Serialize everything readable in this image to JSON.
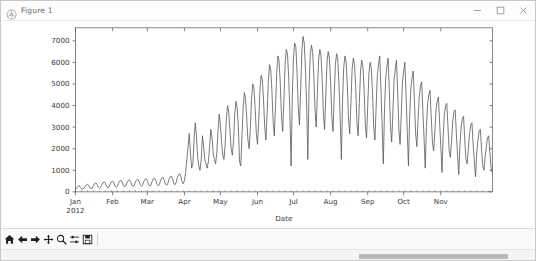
{
  "window": {
    "title": "Figure 1",
    "icon": "matplotlib-icon",
    "controls": {
      "minimize": "minimize-icon",
      "maximize": "maximize-icon",
      "close": "close-icon"
    }
  },
  "toolbar": {
    "items": [
      {
        "name": "home-icon",
        "tooltip": "Reset original view"
      },
      {
        "name": "back-arrow-icon",
        "tooltip": "Back to previous view"
      },
      {
        "name": "forward-arrow-icon",
        "tooltip": "Forward to next view"
      },
      {
        "name": "pan-move-icon",
        "tooltip": "Pan axes with left mouse, zoom with right"
      },
      {
        "name": "zoom-magnifier-icon",
        "tooltip": "Zoom to rectangle"
      },
      {
        "name": "subplot-config-icon",
        "tooltip": "Configure subplots"
      },
      {
        "name": "save-floppy-icon",
        "tooltip": "Save the figure"
      }
    ]
  },
  "scrollbar": {
    "orientation": "horizontal",
    "thumb_left_pct": 67,
    "thumb_width_pct": 28
  },
  "chart_data": {
    "type": "line",
    "title": "",
    "xlabel": "Date",
    "ylabel": "",
    "grid": false,
    "legend": null,
    "line_color": "#555555",
    "line_width": 0.8,
    "ylim": [
      0,
      7600
    ],
    "yticks": [
      0,
      1000,
      2000,
      3000,
      4000,
      5000,
      6000,
      7000
    ],
    "ytick_labels": [
      "0",
      "1000",
      "2000",
      "3000",
      "4000",
      "5000",
      "6000",
      "7000"
    ],
    "xlim": [
      "2012-01-01",
      "2012-11-01"
    ],
    "xticks": [
      "2012-01-01",
      "2012-02-01",
      "2012-03-01",
      "2012-04-01",
      "2012-05-01",
      "2012-06-01",
      "2012-07-01",
      "2012-08-01",
      "2012-09-01",
      "2012-10-01",
      "2012-11-01"
    ],
    "xtick_labels": [
      "Jan",
      "Feb",
      "Mar",
      "Apr",
      "May",
      "Jun",
      "Jul",
      "Aug",
      "Sep",
      "Oct",
      "Nov"
    ],
    "xtick_sublabel_first": "2012",
    "x_start": "2012-01-01",
    "x_step_days": 1,
    "values": [
      120,
      180,
      240,
      300,
      210,
      150,
      130,
      160,
      250,
      320,
      360,
      300,
      190,
      150,
      180,
      290,
      380,
      420,
      350,
      220,
      170,
      200,
      330,
      430,
      470,
      400,
      250,
      190,
      230,
      370,
      470,
      500,
      430,
      280,
      210,
      250,
      400,
      500,
      540,
      460,
      300,
      230,
      270,
      420,
      520,
      560,
      480,
      320,
      250,
      290,
      450,
      550,
      590,
      500,
      340,
      260,
      300,
      470,
      580,
      610,
      520,
      350,
      270,
      310,
      480,
      600,
      640,
      540,
      360,
      280,
      330,
      520,
      640,
      680,
      570,
      380,
      300,
      360,
      560,
      690,
      730,
      620,
      410,
      330,
      420,
      660,
      800,
      840,
      700,
      470,
      380,
      520,
      900,
      1500,
      2100,
      2700,
      1800,
      1100,
      1300,
      2400,
      3200,
      2600,
      1600,
      1200,
      1000,
      1500,
      2600,
      2100,
      1500,
      1300,
      1100,
      1400,
      2100,
      2900,
      2500,
      1800,
      1500,
      1300,
      1800,
      2800,
      3600,
      3100,
      2300,
      1700,
      1500,
      2200,
      3400,
      4000,
      3700,
      2800,
      2000,
      1700,
      2400,
      3600,
      4200,
      3900,
      3000,
      1400,
      1200,
      2600,
      3900,
      4600,
      4300,
      3400,
      2400,
      2000,
      2900,
      4300,
      5000,
      4800,
      3900,
      2700,
      2200,
      3300,
      4700,
      5400,
      5200,
      4300,
      3000,
      2400,
      3600,
      5100,
      5900,
      5700,
      4700,
      3300,
      2600,
      3900,
      5500,
      6300,
      6100,
      5000,
      3500,
      2800,
      4200,
      5900,
      6600,
      6400,
      5300,
      3700,
      1200,
      4400,
      6200,
      6900,
      6700,
      5500,
      3900,
      3100,
      4700,
      6500,
      7200,
      6900,
      5700,
      4000,
      1500,
      4800,
      6300,
      6800,
      6500,
      5400,
      3800,
      3000,
      4600,
      6100,
      6600,
      6300,
      5200,
      3600,
      2900,
      4500,
      6000,
      6500,
      6200,
      5100,
      3500,
      2800,
      4400,
      5900,
      6400,
      6100,
      5000,
      3400,
      1500,
      4300,
      5800,
      6300,
      6000,
      4900,
      3300,
      2700,
      4200,
      5700,
      6200,
      5900,
      4800,
      3200,
      2600,
      4100,
      5600,
      6100,
      5800,
      4700,
      3100,
      2500,
      4000,
      5500,
      6000,
      5700,
      4600,
      3000,
      2400,
      3900,
      5400,
      5900,
      6300,
      4800,
      3100,
      1300,
      3800,
      5300,
      5800,
      6200,
      4700,
      3000,
      2300,
      3700,
      5200,
      5700,
      6100,
      4600,
      2900,
      2200,
      3600,
      5100,
      5600,
      6000,
      4500,
      2800,
      1200,
      3500,
      4800,
      5300,
      5600,
      4200,
      2700,
      2100,
      3300,
      4400,
      4900,
      5100,
      3800,
      2500,
      1100,
      3000,
      4100,
      4500,
      4700,
      3500,
      2300,
      1900,
      2800,
      3800,
      4200,
      4400,
      3200,
      2100,
      900,
      2600,
      3600,
      4000,
      4100,
      3000,
      1900,
      1600,
      2400,
      3300,
      3700,
      3800,
      2700,
      1700,
      800,
      2200,
      3000,
      3400,
      3500,
      2400,
      1500,
      1300,
      2000,
      2700,
      3100,
      3200,
      2200,
      1400,
      700,
      1800,
      2400,
      2800,
      2900,
      2000,
      1200,
      1000,
      1600,
      2100,
      2500,
      2600,
      1800,
      1100,
      900
    ]
  }
}
